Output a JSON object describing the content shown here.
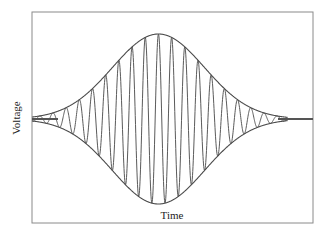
{
  "figure": {
    "ylabel": "Voltage",
    "xlabel": "Time",
    "frame": {
      "x": 32,
      "y": 12,
      "width": 281,
      "height": 211,
      "stroke": "#8a8a8a"
    },
    "colors": {
      "signal": "#5a5a5a",
      "envelope": "#4a4a4a",
      "frame": "#8a8a8a"
    }
  },
  "chart_data": {
    "type": "line",
    "title": "",
    "xlabel": "Time",
    "ylabel": "Voltage",
    "grid": false,
    "legend": null,
    "series": [
      {
        "name": "signal",
        "kind": "carrier",
        "cycles_visible": 16
      },
      {
        "name": "upper envelope",
        "kind": "envelope"
      },
      {
        "name": "lower envelope",
        "kind": "envelope"
      }
    ],
    "envelope_shape": "gaussian",
    "normalized": {
      "x_range": [
        0,
        1
      ],
      "y_range": [
        -1,
        1
      ],
      "envelope_center_x": 0.45,
      "envelope_peak_amplitude": 1.0,
      "baseline_y": 0,
      "oscillation_start_x": 0.1,
      "oscillation_end_x": 0.87
    }
  }
}
